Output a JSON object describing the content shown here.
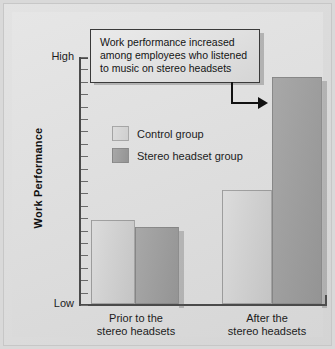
{
  "chart_data": {
    "type": "bar",
    "title": "",
    "subtitle": "",
    "xlabel": "",
    "ylabel": "Work Performance",
    "categories": [
      "Prior to the stereo headsets",
      "After the stereo headsets"
    ],
    "category_lines": [
      [
        "Prior to the",
        "stereo headsets"
      ],
      [
        "After the",
        "stereo headsets"
      ]
    ],
    "series": [
      {
        "name": "Control group",
        "values": [
          34,
          46
        ],
        "color": "#d4d4d4"
      },
      {
        "name": "Stereo headset group",
        "values": [
          31,
          92
        ],
        "color": "#9c9c9c"
      }
    ],
    "ylim": [
      0,
      100
    ],
    "ytick_labels": {
      "low": "Low",
      "high": "High"
    },
    "ytick_count": 20,
    "grid": false,
    "legend_position": "inside-upper-left",
    "annotations": [
      {
        "name": "callout",
        "lines": [
          "Work performance increased",
          "among employees who listened",
          "to music on stereo headsets"
        ],
        "points_to": "After the stereo headsets — Stereo headset group bar"
      }
    ]
  },
  "legend": {
    "items": [
      {
        "label": "Control group",
        "swatch": "light"
      },
      {
        "label": "Stereo headset group",
        "swatch": "dark"
      }
    ]
  },
  "axis": {
    "y_title": "Work Performance",
    "y_high": "High",
    "y_low": "Low"
  },
  "callout": {
    "line1": "Work performance increased",
    "line2": "among employees who listened",
    "line3": "to music on stereo headsets"
  },
  "xaxis": {
    "cat0_line1": "Prior to the",
    "cat0_line2": "stereo headsets",
    "cat1_line1": "After the",
    "cat1_line2": "stereo headsets"
  }
}
